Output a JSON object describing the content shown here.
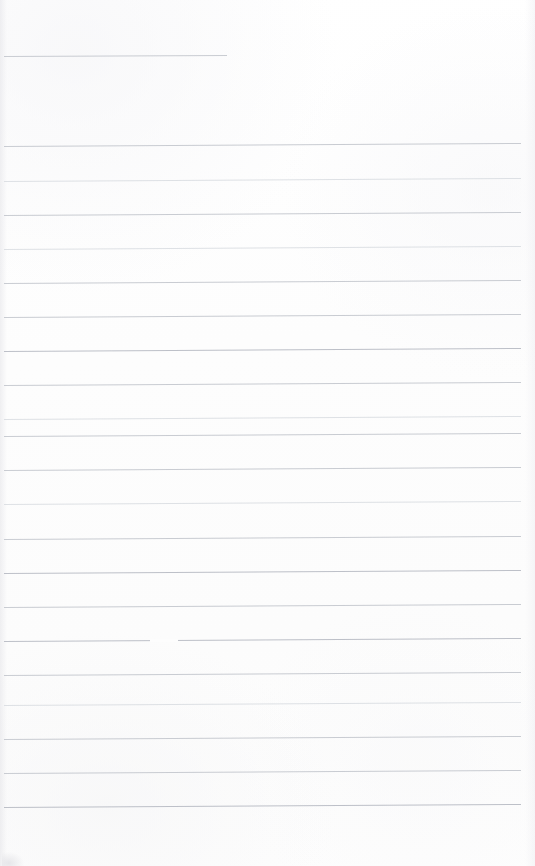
{
  "document": {
    "kind": "scanned-ruled-page",
    "description": "Blank scanned lined notebook page",
    "width": 535,
    "height": 866,
    "content_text": "",
    "background_color": "#fdfdfd",
    "rule_color": "#c9ccd2"
  },
  "page": {
    "margins": {
      "left_px": 4,
      "right_px": 521,
      "top_first_rule_px": 56,
      "bottom_last_rule_px": 807
    },
    "rule_spacing_px": 34.2,
    "rule_count": 21,
    "header_rule": {
      "label": "short-top-rule",
      "y": 56,
      "x_start": 4,
      "x_end": 227,
      "weight": "medium"
    }
  },
  "rules": [
    {
      "y": 56,
      "x1": 4,
      "x2": 227,
      "slope": -1.0,
      "weight": "medium"
    },
    {
      "y": 146,
      "x1": 4,
      "x2": 521,
      "slope": -3.0,
      "weight": "medium"
    },
    {
      "y": 181,
      "x1": 4,
      "x2": 521,
      "slope": -3.0,
      "weight": "faint"
    },
    {
      "y": 215,
      "x1": 4,
      "x2": 521,
      "slope": -3.0,
      "weight": "medium"
    },
    {
      "y": 249,
      "x1": 4,
      "x2": 521,
      "slope": -3.0,
      "weight": "faint"
    },
    {
      "y": 283,
      "x1": 4,
      "x2": 521,
      "slope": -3.0,
      "weight": "medium"
    },
    {
      "y": 317,
      "x1": 4,
      "x2": 521,
      "slope": -3.0,
      "weight": "medium"
    },
    {
      "y": 351,
      "x1": 4,
      "x2": 521,
      "slope": -3.0,
      "weight": "strong"
    },
    {
      "y": 385,
      "x1": 4,
      "x2": 521,
      "slope": -3.0,
      "weight": "medium"
    },
    {
      "y": 419,
      "x1": 4,
      "x2": 521,
      "slope": -3.0,
      "weight": "faint"
    },
    {
      "y": 436,
      "x1": 4,
      "x2": 521,
      "slope": -3.0,
      "weight": "medium"
    },
    {
      "y": 470,
      "x1": 4,
      "x2": 521,
      "slope": -3.0,
      "weight": "medium"
    },
    {
      "y": 504,
      "x1": 4,
      "x2": 521,
      "slope": -3.0,
      "weight": "faint"
    },
    {
      "y": 539,
      "x1": 4,
      "x2": 521,
      "slope": -3.0,
      "weight": "medium"
    },
    {
      "y": 573,
      "x1": 4,
      "x2": 521,
      "slope": -3.0,
      "weight": "strong"
    },
    {
      "y": 607,
      "x1": 4,
      "x2": 521,
      "slope": -3.0,
      "weight": "medium"
    },
    {
      "y": 641,
      "x1": 4,
      "x2": 521,
      "slope": -3.0,
      "weight": "strong"
    },
    {
      "y": 675,
      "x1": 4,
      "x2": 521,
      "slope": -3.0,
      "weight": "medium"
    },
    {
      "y": 705,
      "x1": 4,
      "x2": 521,
      "slope": -3.0,
      "weight": "faint"
    },
    {
      "y": 739,
      "x1": 4,
      "x2": 521,
      "slope": -3.0,
      "weight": "medium"
    },
    {
      "y": 773,
      "x1": 4,
      "x2": 521,
      "slope": -3.0,
      "weight": "medium"
    },
    {
      "y": 807,
      "x1": 4,
      "x2": 521,
      "slope": -3.0,
      "weight": "strong"
    }
  ],
  "artifacts": [
    {
      "type": "rule-break",
      "y": 639,
      "x": 150,
      "width": 28,
      "note": "gap in ruled line"
    },
    {
      "type": "corner-smudge",
      "position": "bottom-left",
      "note": "faint scan shadow"
    }
  ]
}
